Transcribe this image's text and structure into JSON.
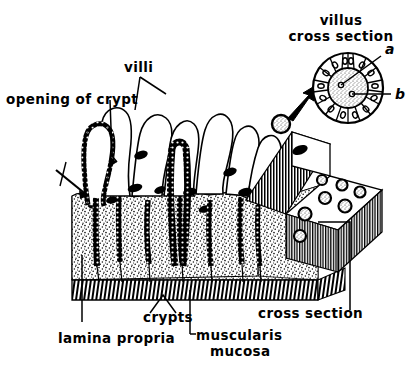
{
  "figure": {
    "title_semantic": "intestinal-villi-and-crypts-anatomical-diagram",
    "background_color": "#ffffff",
    "ink_color": "#000000",
    "labels": {
      "villus_cross_section_line1": "villus",
      "villus_cross_section_line2": "cross section",
      "marker_a": "a",
      "marker_b": "b",
      "villi": "villi",
      "opening_of_crypt": "opening of crypt",
      "crypts": "crypts",
      "lamina_propria": "lamina propria",
      "muscularis_line1": "muscularis",
      "muscularis_line2": "mucosa",
      "cross_section": "cross section"
    },
    "structures": {
      "villi_count": 8,
      "crypts_count": 5,
      "cross_section_villus_profiles": 7,
      "villus_cross_section_cells": 20
    }
  }
}
